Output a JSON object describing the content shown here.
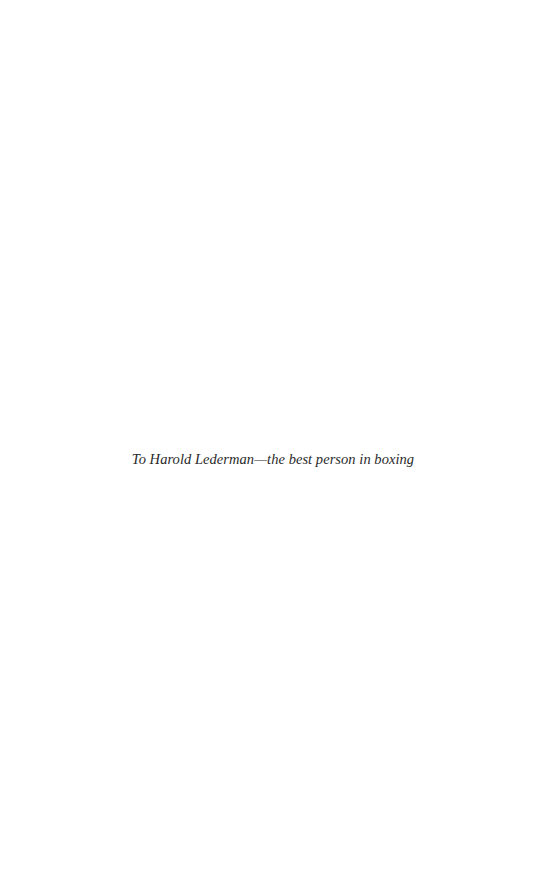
{
  "page": {
    "dedication": "To Harold Lederman—the best person in boxing",
    "background_color": "#ffffff",
    "text_color": "#2a2a2a"
  }
}
